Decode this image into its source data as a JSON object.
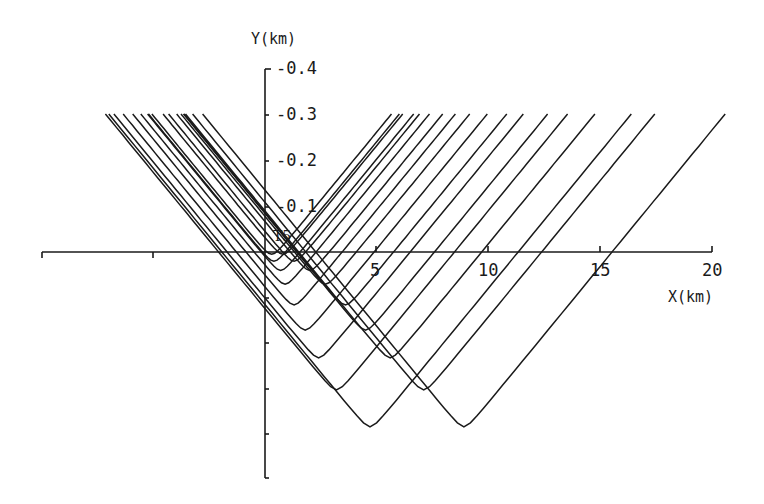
{
  "chart_data": {
    "type": "line",
    "title": "",
    "xlabel": "X(km)",
    "ylabel": "Y(km)",
    "annotation": "T5",
    "x_ticks": [
      -5,
      0,
      5,
      10,
      15,
      20
    ],
    "x_tick_labels": [
      "5",
      "10",
      "15",
      "20"
    ],
    "y_ticks": [
      -0.4,
      -0.3,
      -0.2,
      -0.1,
      0,
      0.1,
      0.2,
      0.3,
      0.4,
      0.5
    ],
    "y_tick_labels": [
      "-0.4",
      "-0.3",
      "-0.2",
      "-0.1"
    ],
    "xlim": [
      -10,
      20
    ],
    "ylim": [
      0.5,
      -0.4
    ],
    "grid": false,
    "legend": "none",
    "series_description": "Family of hyperbolic traveltime curves clipped at Y=-0.3 km; curves come in pairs with minima at increasing depth",
    "curves": [
      {
        "x_min_km": 0.3,
        "y_min_km": 0.005
      },
      {
        "x_min_km": 0.8,
        "y_min_km": 0.005
      },
      {
        "x_min_km": 0.4,
        "y_min_km": 0.02
      },
      {
        "x_min_km": 1.3,
        "y_min_km": 0.02
      },
      {
        "x_min_km": 0.7,
        "y_min_km": 0.04
      },
      {
        "x_min_km": 2.0,
        "y_min_km": 0.04
      },
      {
        "x_min_km": 0.9,
        "y_min_km": 0.07
      },
      {
        "x_min_km": 2.7,
        "y_min_km": 0.07
      },
      {
        "x_min_km": 1.3,
        "y_min_km": 0.115
      },
      {
        "x_min_km": 3.6,
        "y_min_km": 0.115
      },
      {
        "x_min_km": 1.8,
        "y_min_km": 0.17
      },
      {
        "x_min_km": 4.5,
        "y_min_km": 0.17
      },
      {
        "x_min_km": 2.4,
        "y_min_km": 0.23
      },
      {
        "x_min_km": 5.6,
        "y_min_km": 0.23
      },
      {
        "x_min_km": 3.2,
        "y_min_km": 0.3
      },
      {
        "x_min_km": 7.1,
        "y_min_km": 0.3
      },
      {
        "x_min_km": 4.7,
        "y_min_km": 0.38
      },
      {
        "x_min_km": 8.9,
        "y_min_km": 0.38
      }
    ]
  },
  "labels": {
    "y_axis_title": "Y(km)",
    "x_axis_title": "X(km)",
    "annotation": "T5",
    "y_ticks": [
      "-0.4",
      "-0.3",
      "-0.2",
      "-0.1"
    ],
    "x_ticks": [
      "5",
      "10",
      "15",
      "20"
    ]
  }
}
